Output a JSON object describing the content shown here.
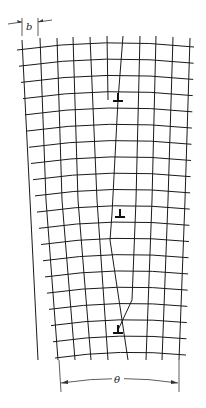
{
  "figure": {
    "labels": {
      "spacing": "b",
      "angle": "θ"
    },
    "dislocation_symbol": "⊥",
    "dislocations": [
      {
        "x": 118,
        "y": 98
      },
      {
        "x": 120,
        "y": 214
      },
      {
        "x": 118,
        "y": 330
      }
    ],
    "colors": {
      "line": "#1a1a1a",
      "background": "#ffffff"
    }
  }
}
